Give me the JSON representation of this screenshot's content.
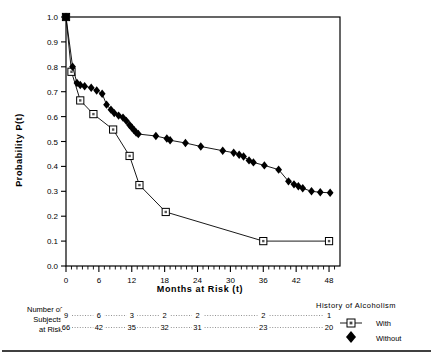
{
  "chart_data": {
    "type": "line",
    "title": "",
    "xlabel": "Months at Risk  (t)",
    "ylabel": "Probability   P(t)",
    "xlim": [
      0,
      50
    ],
    "ylim": [
      0.0,
      1.0
    ],
    "grid": false,
    "legend_position": "bottom-right",
    "legend_title": "History of Alcoholism",
    "xticks": [
      0,
      6,
      12,
      18,
      24,
      30,
      36,
      42,
      48
    ],
    "xtick_labels": [
      "0",
      "6",
      "12",
      "18",
      "24",
      "30",
      "36",
      "42",
      "48"
    ],
    "minor_xtick_interval": 1,
    "yticks": [
      0.0,
      0.1,
      0.2,
      0.3,
      0.4,
      0.5,
      0.6,
      0.7,
      0.8,
      0.9,
      1.0
    ],
    "ytick_labels": [
      "0.0",
      "0.1",
      "0.2",
      "0.3",
      "0.4",
      "0.5",
      "0.6",
      "0.7",
      "0.8",
      "0.9",
      "1.0"
    ],
    "series": [
      {
        "name": "With",
        "marker": "open-square",
        "color": "#000000",
        "points": [
          {
            "x": 0.0,
            "y": 1.0
          },
          {
            "x": 1.0,
            "y": 0.78
          },
          {
            "x": 2.6,
            "y": 0.665
          },
          {
            "x": 5.0,
            "y": 0.61
          },
          {
            "x": 8.6,
            "y": 0.548
          },
          {
            "x": 11.6,
            "y": 0.442
          },
          {
            "x": 13.4,
            "y": 0.325
          },
          {
            "x": 18.2,
            "y": 0.217
          },
          {
            "x": 36.0,
            "y": 0.1
          },
          {
            "x": 48.0,
            "y": 0.1
          }
        ]
      },
      {
        "name": "Without",
        "marker": "filled-diamond",
        "color": "#000000",
        "points": [
          {
            "x": 0.0,
            "y": 1.0
          },
          {
            "x": 1.2,
            "y": 0.8
          },
          {
            "x": 2.0,
            "y": 0.735
          },
          {
            "x": 2.6,
            "y": 0.727
          },
          {
            "x": 3.4,
            "y": 0.722
          },
          {
            "x": 4.6,
            "y": 0.716
          },
          {
            "x": 5.6,
            "y": 0.705
          },
          {
            "x": 6.6,
            "y": 0.692
          },
          {
            "x": 7.4,
            "y": 0.648
          },
          {
            "x": 8.2,
            "y": 0.628
          },
          {
            "x": 8.8,
            "y": 0.614
          },
          {
            "x": 9.6,
            "y": 0.604
          },
          {
            "x": 10.4,
            "y": 0.596
          },
          {
            "x": 11.0,
            "y": 0.583
          },
          {
            "x": 11.6,
            "y": 0.566
          },
          {
            "x": 12.0,
            "y": 0.556
          },
          {
            "x": 12.4,
            "y": 0.546
          },
          {
            "x": 12.8,
            "y": 0.536
          },
          {
            "x": 13.2,
            "y": 0.53
          },
          {
            "x": 16.4,
            "y": 0.522
          },
          {
            "x": 18.4,
            "y": 0.512
          },
          {
            "x": 19.0,
            "y": 0.505
          },
          {
            "x": 21.8,
            "y": 0.494
          },
          {
            "x": 24.6,
            "y": 0.48
          },
          {
            "x": 28.6,
            "y": 0.463
          },
          {
            "x": 30.6,
            "y": 0.455
          },
          {
            "x": 31.6,
            "y": 0.447
          },
          {
            "x": 32.4,
            "y": 0.44
          },
          {
            "x": 33.4,
            "y": 0.424
          },
          {
            "x": 34.2,
            "y": 0.416
          },
          {
            "x": 36.2,
            "y": 0.404
          },
          {
            "x": 38.8,
            "y": 0.387
          },
          {
            "x": 40.6,
            "y": 0.34
          },
          {
            "x": 41.6,
            "y": 0.328
          },
          {
            "x": 42.4,
            "y": 0.32
          },
          {
            "x": 43.2,
            "y": 0.312
          },
          {
            "x": 44.8,
            "y": 0.3
          },
          {
            "x": 46.4,
            "y": 0.296
          },
          {
            "x": 48.2,
            "y": 0.294
          }
        ]
      }
    ]
  },
  "risk_table": {
    "label_lines": [
      "Number of",
      "Subjects",
      "at Risk"
    ],
    "columns_months": [
      0,
      6,
      12,
      18,
      24,
      36,
      48
    ],
    "rows": [
      {
        "series": "With",
        "counts": [
          "9",
          "6",
          "3",
          "2",
          "2",
          "2",
          "1"
        ]
      },
      {
        "series": "Without",
        "counts": [
          "66",
          "42",
          "35",
          "32",
          "31",
          "23",
          "20"
        ]
      }
    ]
  },
  "legend": {
    "title": "History of Alcoholism",
    "entries": [
      {
        "label": "With",
        "marker": "open-square"
      },
      {
        "label": "Without",
        "marker": "filled-diamond"
      }
    ]
  }
}
